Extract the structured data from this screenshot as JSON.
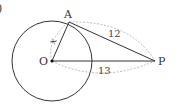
{
  "diagram": {
    "corner_mark": ")",
    "points": {
      "O": {
        "label": "O",
        "x": 52,
        "y": 61
      },
      "A": {
        "label": "A",
        "x": 69,
        "y": 22
      },
      "P": {
        "label": "P",
        "x": 155,
        "y": 61
      }
    },
    "circle": {
      "cx": 52,
      "cy": 61,
      "r": 40
    },
    "segments": [
      {
        "from": "O",
        "to": "A"
      },
      {
        "from": "A",
        "to": "P"
      },
      {
        "from": "O",
        "to": "P"
      }
    ],
    "measures": {
      "OA": "x",
      "AP": "12",
      "OP": "13"
    },
    "colors": {
      "stroke": "#333333",
      "dashed": "#aaaaaa"
    }
  }
}
